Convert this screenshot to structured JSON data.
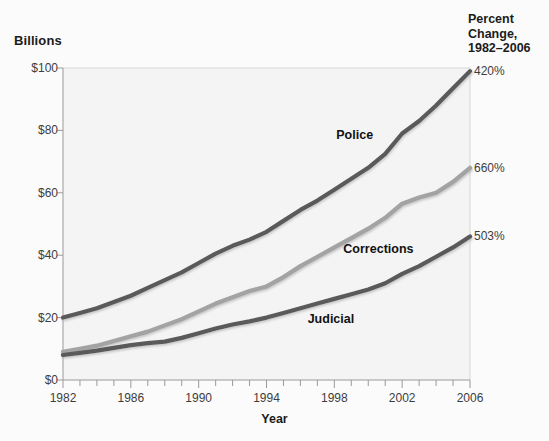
{
  "axis_titles": {
    "y_units": "Billions",
    "x_title": "Year"
  },
  "percent_change_header": "Percent Change, 1982–2006",
  "chart_data": {
    "type": "line",
    "title": "",
    "subtitle": "",
    "xlabel": "Year",
    "ylabel": "Billions",
    "ylim": [
      0,
      100
    ],
    "xlim": [
      1982,
      2006
    ],
    "grid": false,
    "legend_position": "inline-annotations",
    "y_tick_labels": [
      "$0",
      "$20",
      "$40",
      "$60",
      "$80",
      "$100"
    ],
    "y_tick_values": [
      0,
      20,
      40,
      60,
      80,
      100
    ],
    "x_tick_labels": [
      "1982",
      "1986",
      "1990",
      "1994",
      "1998",
      "2002",
      "2006"
    ],
    "x_tick_values": [
      1982,
      1986,
      1990,
      1994,
      1998,
      2002,
      2006
    ],
    "x_minor_ticks_every": 1,
    "x": [
      1982,
      1983,
      1984,
      1985,
      1986,
      1987,
      1988,
      1989,
      1990,
      1991,
      1992,
      1993,
      1994,
      1995,
      1996,
      1997,
      1998,
      1999,
      2000,
      2001,
      2002,
      2003,
      2004,
      2005,
      2006
    ],
    "series": [
      {
        "name": "Police",
        "color": "#5a5a5a",
        "percent_change": "420%",
        "values": [
          20.0,
          21.5,
          23.0,
          25.0,
          27.0,
          29.5,
          32.0,
          34.5,
          37.5,
          40.5,
          43.0,
          45.0,
          47.5,
          51.0,
          54.5,
          57.5,
          61.0,
          64.5,
          68.0,
          72.5,
          79.0,
          83.0,
          88.0,
          93.5,
          99.0
        ]
      },
      {
        "name": "Corrections",
        "color": "#a3a3a3",
        "percent_change": "660%",
        "values": [
          9.0,
          10.0,
          11.0,
          12.5,
          14.0,
          15.5,
          17.5,
          19.5,
          22.0,
          24.5,
          26.5,
          28.5,
          30.0,
          33.0,
          36.5,
          39.5,
          42.5,
          45.5,
          48.5,
          52.0,
          56.5,
          58.5,
          60.0,
          63.5,
          68.0
        ]
      },
      {
        "name": "Judicial",
        "color": "#5a5a5a",
        "percent_change": "503%",
        "values": [
          8.0,
          8.7,
          9.4,
          10.3,
          11.2,
          11.8,
          12.3,
          13.5,
          15.0,
          16.5,
          17.8,
          18.8,
          20.0,
          21.5,
          23.0,
          24.5,
          26.0,
          27.5,
          29.0,
          31.0,
          34.0,
          36.5,
          39.5,
          42.5,
          46.0
        ]
      }
    ],
    "series_label_positions": [
      {
        "name": "Police",
        "x": 1999.2,
        "y": 78.5
      },
      {
        "name": "Corrections",
        "x": 2000.6,
        "y": 42.0
      },
      {
        "name": "Judicial",
        "x": 1997.8,
        "y": 19.5
      }
    ]
  },
  "plot_geometry": {
    "left": 63,
    "right": 470,
    "top": 68,
    "bottom": 380
  },
  "colors": {
    "background": "#fbfbfb",
    "plot_fill": "#f4f4f4",
    "frame": "#d6d6d6",
    "tick_text": "#3d3d3d",
    "heading_text": "#1b1b1b"
  }
}
